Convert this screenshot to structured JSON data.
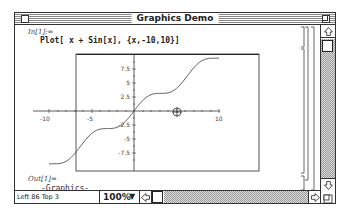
{
  "window": {
    "title": "Graphics Demo"
  },
  "notebook": {
    "input_label": "In[1]:=",
    "input_code": "Plot[ x + Sin[x], {x,-10,10}]",
    "output_label": "Out[1]=",
    "output_text": "-Graphics-"
  },
  "status": {
    "position": "Left 86 Top 3",
    "zoom": "100%"
  },
  "icons": {
    "close_box": "close-box-icon",
    "zoom_box": "zoom-box-icon",
    "scroll_up": "arrow-up-icon",
    "scroll_down": "arrow-down-icon",
    "scroll_right": "arrow-right-icon",
    "scroll_left": "arrow-left-icon",
    "grow_box": "resize-grip-icon",
    "cursor": "crosshair-cursor-icon"
  },
  "chart_data": {
    "type": "line",
    "title": "",
    "function": "x + Sin[x]",
    "xlabel": "",
    "ylabel": "",
    "xlim": [
      -10,
      10
    ],
    "ylim": [
      -10.5,
      10.5
    ],
    "x_ticks": [
      "-10",
      "-5",
      "10"
    ],
    "y_ticks": [
      "7.5",
      "5",
      "2.5",
      "-2.5",
      "-5",
      "-7.5"
    ],
    "series": [
      {
        "name": "x + Sin[x]",
        "x": [
          -10,
          -9,
          -8,
          -7,
          -6,
          -5,
          -4,
          -3,
          -2,
          -1,
          0,
          1,
          2,
          3,
          4,
          5,
          6,
          7,
          8,
          9,
          10
        ],
        "values": [
          -9.46,
          -9.41,
          -8.99,
          -7.66,
          -5.72,
          -4.04,
          -3.24,
          -3.14,
          -2.91,
          -1.84,
          0,
          1.84,
          2.91,
          3.14,
          3.24,
          4.04,
          5.72,
          7.66,
          8.99,
          9.41,
          9.46
        ]
      }
    ],
    "grid": false,
    "frame": true
  }
}
